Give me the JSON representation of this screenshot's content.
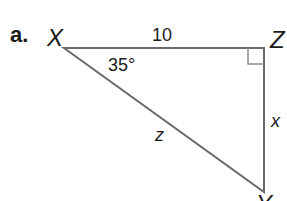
{
  "problem": {
    "part_label": "a.",
    "vertices": {
      "top_left": "X",
      "top_right": "Z",
      "bottom": "Y"
    },
    "side_labels": {
      "XZ": "10",
      "XY": "z",
      "ZY": "x"
    },
    "angle_label": "35°",
    "right_angle_at": "Z"
  },
  "colors": {
    "stroke": "#6b6b6b",
    "text": "#1a1a1a",
    "background": "#ffffff"
  }
}
